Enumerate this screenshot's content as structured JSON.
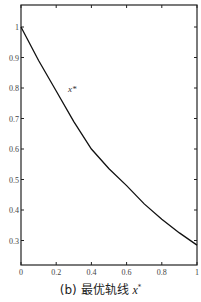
{
  "chart_data": {
    "type": "line",
    "title": "",
    "caption": "(b) 最优轨线 x*",
    "xlabel": "t",
    "ylabel": "",
    "xlim": [
      0,
      1
    ],
    "ylim": [
      0.215,
      1.07
    ],
    "xticks": [
      0,
      0.2,
      0.4,
      0.6,
      0.8,
      1
    ],
    "xtick_labels": [
      "0",
      "0.2",
      "0.4",
      "0.6",
      "0.8",
      "1"
    ],
    "yticks": [
      0.3,
      0.4,
      0.5,
      0.6,
      0.7,
      0.8,
      0.9,
      1
    ],
    "ytick_labels": [
      "0.3",
      "0.4",
      "0.5",
      "0.6",
      "0.7",
      "0.8",
      "0.9",
      "1"
    ],
    "grid": false,
    "series": [
      {
        "name": "x*",
        "x": [
          0,
          0.1,
          0.2,
          0.3,
          0.4,
          0.5,
          0.6,
          0.7,
          0.8,
          0.9,
          1.0
        ],
        "values": [
          1.0,
          0.89,
          0.79,
          0.69,
          0.6,
          0.535,
          0.48,
          0.42,
          0.37,
          0.325,
          0.285
        ]
      }
    ],
    "annotations": [
      {
        "text": "x*",
        "x": 0.27,
        "y": 0.8
      }
    ]
  },
  "caption": {
    "prefix": "(b) 最优轨线 ",
    "var": "x",
    "sup": "*"
  },
  "axis_label_x": "t",
  "curve_label": "x*"
}
